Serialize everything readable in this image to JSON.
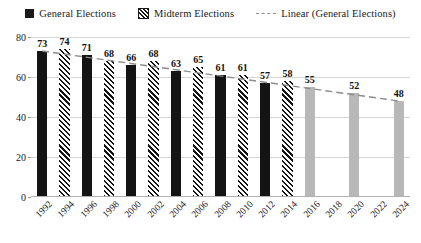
{
  "legend": {
    "items": [
      {
        "label": "General Elections",
        "marker": "solid-square-icon",
        "color": "#141414"
      },
      {
        "label": "Midterm Elections",
        "marker": "hatched-square-icon",
        "color": "#141414"
      },
      {
        "label": "Linear (General Elections)",
        "marker": "dashed-line-icon",
        "color": "#8c8c8c"
      }
    ]
  },
  "chart_data": {
    "type": "bar",
    "title": "",
    "xlabel": "",
    "ylabel": "",
    "ylim": [
      0,
      80
    ],
    "yticks": [
      0,
      20,
      40,
      60,
      80
    ],
    "grid": true,
    "legend_position": "top",
    "categories": [
      "1992",
      "1994",
      "1996",
      "1998",
      "2000",
      "2002",
      "2004",
      "2006",
      "2008",
      "2010",
      "2012",
      "2014",
      "2016",
      "2018",
      "2020",
      "2022",
      "2024"
    ],
    "values": [
      73,
      74,
      71,
      68,
      66,
      68,
      63,
      65,
      61,
      61,
      57,
      58,
      55,
      null,
      52,
      null,
      48
    ],
    "bar_kinds": [
      "general",
      "midterm",
      "general",
      "midterm",
      "general",
      "midterm",
      "general",
      "midterm",
      "general",
      "midterm",
      "general",
      "midterm",
      "forecast",
      "none",
      "forecast",
      "none",
      "forecast"
    ],
    "series": [
      {
        "name": "General Elections",
        "values": [
          73,
          null,
          71,
          null,
          66,
          null,
          63,
          null,
          61,
          null,
          57,
          null,
          null,
          null,
          null,
          null,
          null
        ]
      },
      {
        "name": "Midterm Elections",
        "values": [
          null,
          74,
          null,
          68,
          null,
          68,
          null,
          65,
          null,
          61,
          null,
          58,
          null,
          null,
          null,
          null,
          null
        ]
      },
      {
        "name": "Forecast",
        "values": [
          null,
          null,
          null,
          null,
          null,
          null,
          null,
          null,
          null,
          null,
          null,
          null,
          55,
          null,
          52,
          null,
          48
        ]
      }
    ],
    "trendline": {
      "name": "Linear (General Elections)",
      "style": "dashed",
      "color": "#8c8c8c",
      "start": {
        "x": "1992",
        "y": 73
      },
      "end": {
        "x": "2024",
        "y": 48
      }
    },
    "colors": {
      "general": "#141414",
      "midterm": "#141414",
      "forecast": "#b8b8b8",
      "grid": "#d6d6d6",
      "trend": "#8c8c8c"
    }
  }
}
